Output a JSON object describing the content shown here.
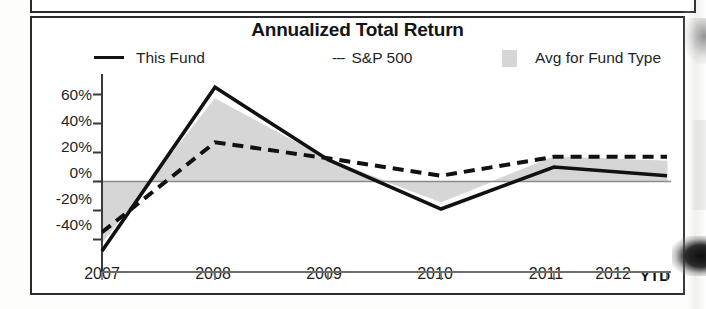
{
  "chart_data": {
    "type": "line",
    "title": "Annualized Total Return",
    "xlabel": "",
    "ylabel": "",
    "categories": [
      "2007",
      "2008",
      "2009",
      "2010",
      "2011",
      "2012 YTD"
    ],
    "x_tick_labels": [
      "2007",
      "2008",
      "2009",
      "2010",
      "2011",
      "2012"
    ],
    "x_suffix_label": "YTD",
    "y_tick_labels": [
      "60%",
      "40%",
      "20%",
      "0%",
      "-20%",
      "-40%"
    ],
    "y_tick_values": [
      60,
      40,
      20,
      0,
      -20,
      -40
    ],
    "ylim": [
      -50,
      70
    ],
    "grid": false,
    "zero_line": true,
    "legend_position": "top",
    "series": [
      {
        "name": "This Fund",
        "style": "solid",
        "color": "#111111",
        "values": [
          -48,
          65,
          15,
          -19,
          10,
          4
        ]
      },
      {
        "name": "S&P 500",
        "style": "dashed",
        "color": "#111111",
        "values": [
          -35,
          27,
          16,
          4,
          17,
          17
        ]
      },
      {
        "name": "Avg for Fund Type",
        "style": "filled-area",
        "color": "#d6d6d6",
        "values": [
          -42,
          57,
          15,
          -14,
          17,
          14
        ]
      }
    ]
  },
  "legend": {
    "this_fund": "This Fund",
    "sp500": "S&P 500",
    "sp500_prefix": "---",
    "avg_fund_type": "Avg for Fund Type"
  },
  "axis": {
    "y_labels": [
      "60%",
      "40%",
      "20%",
      "0%",
      "-20%",
      "-40%"
    ],
    "x_labels": [
      "2007",
      "2008",
      "2009",
      "2010",
      "2011",
      "2012"
    ],
    "ytd_label": "YTD"
  },
  "colors": {
    "line": "#111111",
    "area": "#d6d6d6",
    "frame": "#2b2b2b",
    "text": "#1f1f1f"
  }
}
